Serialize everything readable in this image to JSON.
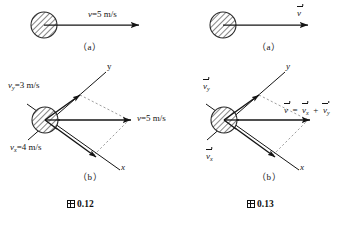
{
  "figure": {
    "background_color": "#ffffff",
    "ink_color": "#141414",
    "ball_fill": "#e6e6e6"
  },
  "left_figure": {
    "caption_number": "0.12",
    "caption_prefix_icon": "cjk-tu-character",
    "panel_a": {
      "sublabel": "（a）",
      "ball": {
        "name": "hatched-ball",
        "cx": 44,
        "cy": 25,
        "r": 13
      },
      "velocity_arrow": {
        "label_symbol": "v",
        "label_equals": "=",
        "label_value": "5",
        "label_unit": "m/s"
      },
      "velocity_label_full": "v=5 m/s"
    },
    "panel_b": {
      "sublabel": "（b）",
      "axis_y_label": "y",
      "axis_x_label": "x",
      "ball": {
        "name": "hatched-ball",
        "cx": 45,
        "cy": 120,
        "r": 13
      },
      "vector_vy_label": "v_y=3 m/s",
      "vector_vy_symbol": "v",
      "vector_vy_sub": "y",
      "vector_vy_value": "3",
      "vector_vx_label": "v_x=4 m/s",
      "vector_vx_symbol": "v",
      "vector_vx_sub": "x",
      "vector_vx_value": "4",
      "vector_v_label": "v=5 m/s",
      "vector_v_symbol": "v",
      "vector_v_value": "5",
      "unit": "m/s",
      "equals": "="
    }
  },
  "right_figure": {
    "caption_number": "0.13",
    "caption_prefix_icon": "cjk-tu-character",
    "panel_a": {
      "sublabel": "（a）",
      "ball": {
        "name": "hatched-ball",
        "cx": 223,
        "cy": 25,
        "r": 13
      },
      "velocity_arrow_symbol": "v"
    },
    "panel_b": {
      "sublabel": "（b）",
      "axis_y_label": "y",
      "axis_x_label": "x",
      "ball": {
        "name": "hatched-ball",
        "cx": 224,
        "cy": 120,
        "r": 13
      },
      "vector_vy_symbol": "v",
      "vector_vy_sub": "y",
      "vector_vx_symbol": "v",
      "vector_vx_sub": "x",
      "equation": {
        "lhs_symbol": "v",
        "equals": "=",
        "term1_symbol": "v",
        "term1_sub": "x",
        "plus": "+",
        "term2_symbol": "v",
        "term2_sub": "y"
      }
    }
  }
}
